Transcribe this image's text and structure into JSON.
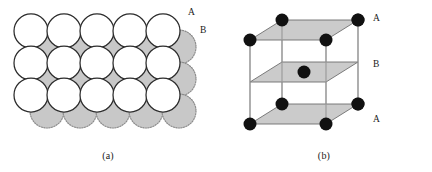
{
  "figure": {
    "width": 432,
    "height": 172,
    "background_color": "#ffffff"
  },
  "colors": {
    "layer_a_fill": "#ffffff",
    "layer_a_stroke": "#2b2b2b",
    "layer_b_fill": "#c8c8c8",
    "layer_b_stroke": "#8c8c8c",
    "plane_fill": "#c8c8c8",
    "plane_stroke": "#6e6e6e",
    "atom_fill": "#111111",
    "edge_stroke": "#9a9a9a",
    "text_color": "#1a1a1a"
  },
  "panel_a": {
    "caption": "(a)",
    "label_a": "A",
    "label_b": "B",
    "layer_a": {
      "name": "A",
      "style": "solid-outline-open-circle",
      "radius": 17,
      "spacing_x": 33,
      "spacing_y": 32,
      "origin_x": 31,
      "origin_y": 31,
      "columns": 5,
      "rows": 3
    },
    "layer_b": {
      "name": "B",
      "style": "dotted-outline-gray-filled-circle",
      "radius": 17,
      "spacing_x": 33,
      "spacing_y": 32,
      "origin_x": 47,
      "origin_y": 47,
      "columns": 5,
      "rows": 3
    }
  },
  "panel_b": {
    "caption": "(b)",
    "labels": [
      {
        "text": "A",
        "position": "top"
      },
      {
        "text": "B",
        "position": "middle"
      },
      {
        "text": "A",
        "position": "bottom"
      }
    ],
    "cell": {
      "front_left_x": 34,
      "front_right_x": 110,
      "depth_dx": 32,
      "depth_dy": -20,
      "top_y": 40,
      "mid_y": 82,
      "bottom_y": 124
    },
    "planes": [
      {
        "name": "A",
        "level": "top",
        "atoms": 4,
        "atom_positions": "corners"
      },
      {
        "name": "B",
        "level": "middle",
        "atoms": 1,
        "atom_positions": "center"
      },
      {
        "name": "A",
        "level": "bottom",
        "atoms": 4,
        "atom_positions": "corners"
      }
    ],
    "atom_radius": 6.5
  }
}
